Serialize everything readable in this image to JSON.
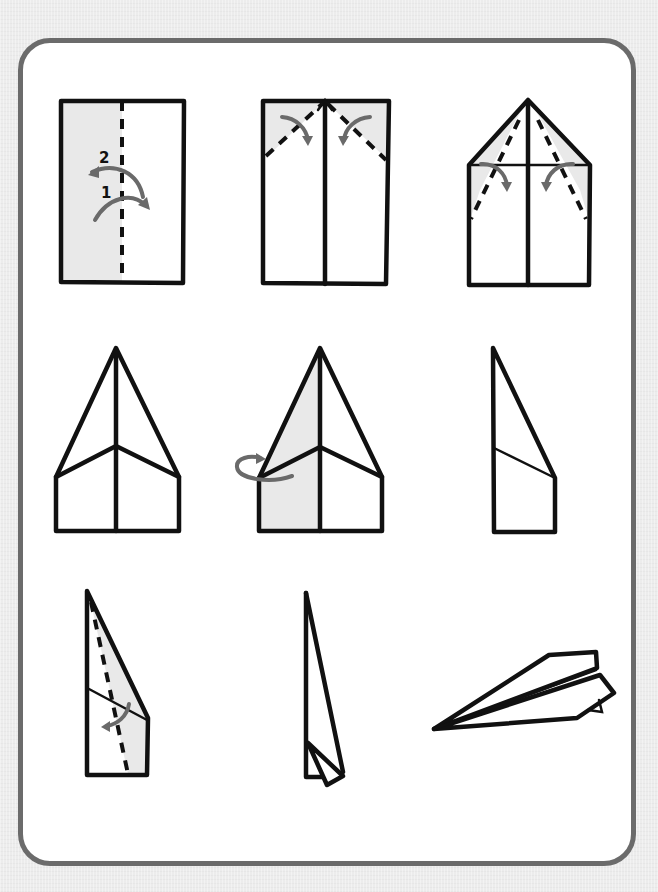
{
  "diagram": {
    "colors": {
      "background": "#ececec",
      "frame_border": "#6b6b6b",
      "panel": "#ffffff",
      "ink": "#111111",
      "shade": "#e9e9e9",
      "arrow": "#6a6a6a"
    },
    "layout": {
      "rows": 3,
      "columns": 3
    },
    "steps": [
      {
        "index": 1,
        "description": "Fold sheet in half lengthwise along dashed center line, then unfold",
        "labels": [
          "2",
          "1"
        ]
      },
      {
        "index": 2,
        "description": "Fold top corners down to the center crease"
      },
      {
        "index": 3,
        "description": "Fold the new slanted edges in to the center crease again"
      },
      {
        "index": 4,
        "description": "Result: pointed nose with folded flaps"
      },
      {
        "index": 5,
        "description": "Fold the plane in half backward along the center"
      },
      {
        "index": 6,
        "description": "Side view of plane folded in half"
      },
      {
        "index": 7,
        "description": "Fold the wing down along the dashed line"
      },
      {
        "index": 8,
        "description": "Repeat on the other side"
      },
      {
        "index": 9,
        "description": "Finished paper airplane"
      }
    ]
  }
}
